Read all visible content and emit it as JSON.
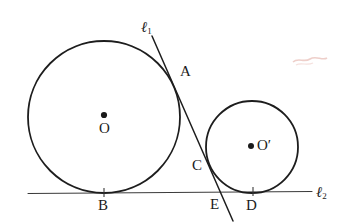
{
  "figure": {
    "canvas": {
      "width": 348,
      "height": 223,
      "background": "#ffffff"
    },
    "stroke_color": "#1d1d1d",
    "label_color": "#1b1b1b",
    "circles": [
      {
        "name": "large-circle",
        "center_label": "O",
        "cx": 104,
        "cy": 117,
        "r": 76,
        "center_dot_label": "O"
      },
      {
        "name": "small-circle",
        "center_label": "O′",
        "cx": 252,
        "cy": 147,
        "r": 46,
        "center_dot_label": "O′"
      }
    ],
    "lines": [
      {
        "name": "tangent-line-l1",
        "label": "ℓ",
        "label_sub": "1",
        "x1": 152,
        "y1": 36,
        "x2": 233,
        "y2": 221
      },
      {
        "name": "base-line-l2",
        "label": "ℓ",
        "label_sub": "2",
        "x1": 28,
        "y1": 193,
        "x2": 312,
        "y2": 191
      }
    ],
    "points": [
      {
        "name": "point-A",
        "label": "A",
        "x": 174,
        "y": 76,
        "label_x": 180,
        "label_y": 65,
        "tick": false
      },
      {
        "name": "point-B",
        "label": "B",
        "x": 104,
        "y": 193,
        "label_x": 98,
        "label_y": 199,
        "tick": true
      },
      {
        "name": "point-C",
        "label": "C",
        "x": 211,
        "y": 166,
        "label_x": 193,
        "label_y": 158,
        "tick": false
      },
      {
        "name": "point-D",
        "label": "D",
        "x": 253,
        "y": 192,
        "label_x": 246,
        "label_y": 198,
        "tick": true
      },
      {
        "name": "point-E",
        "label": "E",
        "x": 223,
        "y": 192,
        "label_x": 211,
        "label_y": 197,
        "tick": true
      },
      {
        "name": "point-O",
        "label": "O",
        "x": 104,
        "y": 116,
        "label_x": 99,
        "label_y": 121,
        "tick": false
      },
      {
        "name": "point-O-prime",
        "label": "O′",
        "x": 252,
        "y": 146,
        "label_x": 258,
        "label_y": 138,
        "tick": false
      }
    ],
    "line_labels": [
      {
        "name": "label-l1",
        "text": "ℓ",
        "sub": "1",
        "x": 141,
        "y": 20
      },
      {
        "name": "label-l2",
        "text": "ℓ",
        "sub": "2",
        "x": 316,
        "y": 186
      }
    ],
    "artifacts": [
      {
        "name": "scan-smudge",
        "color": "#e8b9b2",
        "x": 292,
        "y": 52,
        "width": 34,
        "height": 14
      }
    ]
  }
}
